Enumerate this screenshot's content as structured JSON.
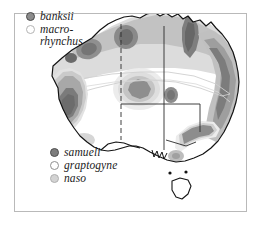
{
  "figure": {
    "frame_color": "#b9b9b9",
    "background_color": "#ffffff"
  },
  "legends": {
    "top": {
      "position": "top-left",
      "items": [
        {
          "label": "banksii",
          "marker": "dark-ring-circle",
          "marker_color": "#8c8c8c"
        },
        {
          "label": "macro-\nrhynchus",
          "marker": "light-ring-circle",
          "marker_color": "#ffffff"
        }
      ]
    },
    "bottom": {
      "position": "bottom-center",
      "items": [
        {
          "label": "samueli",
          "marker": "dark-filled-circle",
          "marker_color": "#7d7d7d"
        },
        {
          "label": "graptogyne",
          "marker": "open-circle",
          "marker_color": "#ffffff"
        },
        {
          "label": "naso",
          "marker": "light-filled-circle",
          "marker_color": "#d3d3d3"
        }
      ]
    }
  },
  "map": {
    "region": "Australia",
    "islands": [
      "Tasmania"
    ],
    "coastline_color": "#1a1a1a",
    "border_lines": [
      "dashed-western-border",
      "solid-central-border",
      "solid-eastern-border"
    ],
    "density_shading": {
      "base": "#e6e6e6",
      "mid": "#c6c6c6",
      "high": "#9a9a9a",
      "peak": "#7a7a7a"
    },
    "hotspots": [
      "south-west",
      "north-central",
      "north-coast",
      "east-coast",
      "south-east"
    ]
  }
}
